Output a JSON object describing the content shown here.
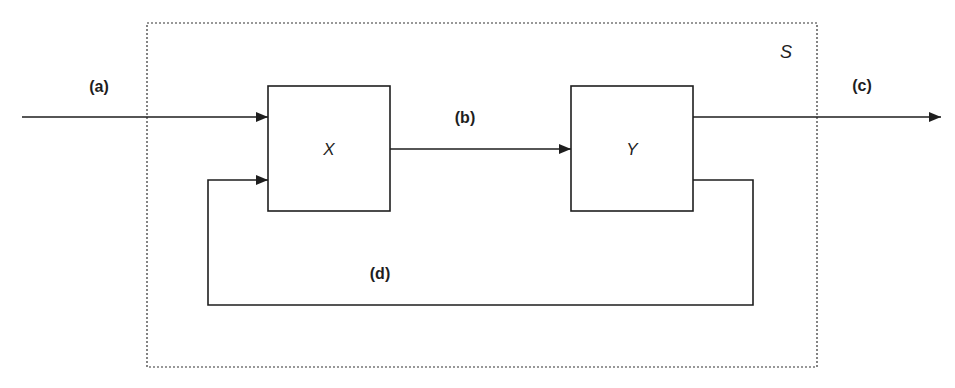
{
  "diagram": {
    "system": {
      "label": "S",
      "border_style": "dotted"
    },
    "blocks": [
      {
        "id": "X",
        "label": "X"
      },
      {
        "id": "Y",
        "label": "Y"
      }
    ],
    "signals": [
      {
        "id": "a",
        "label": "(a)",
        "from": "external-input",
        "to": "X",
        "description": "input"
      },
      {
        "id": "b",
        "label": "(b)",
        "from": "X",
        "to": "Y",
        "description": "intermediate"
      },
      {
        "id": "c",
        "label": "(c)",
        "from": "Y",
        "to": "external-output",
        "description": "output"
      },
      {
        "id": "d",
        "label": "(d)",
        "from": "Y",
        "to": "X",
        "description": "feedback"
      }
    ],
    "colors": {
      "line": "#1e1e1e",
      "background": "#ffffff",
      "system_border": "#333333"
    }
  }
}
